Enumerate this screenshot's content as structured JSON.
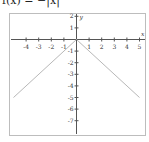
{
  "title": "f(x) = −|x|",
  "colors": {
    "frame": "#bdbdbd",
    "axis": "#555555",
    "curve": "#b8b8b8",
    "text": "#333333"
  },
  "chart_data": {
    "type": "line",
    "title": "f(x) = −|x|",
    "xlabel": "x",
    "ylabel": "y",
    "xlim": [
      -5.3,
      5.2
    ],
    "ylim": [
      -8,
      2.3
    ],
    "grid": false,
    "x_ticks": [
      -4,
      -3,
      -2,
      -1,
      1,
      2,
      3,
      4,
      5
    ],
    "y_ticks": [
      2,
      1,
      -1,
      -2,
      -3,
      -4,
      -5,
      -6,
      -7
    ],
    "series": [
      {
        "name": "f(x) = -|x|",
        "x": [
          -5,
          0,
          5
        ],
        "y": [
          -5,
          0,
          -5
        ]
      }
    ]
  }
}
